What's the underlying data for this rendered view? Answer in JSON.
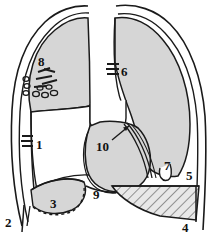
{
  "figure": {
    "name": "chest-radiograph-line-diagram",
    "colors": {
      "ink": "#1a1a1a",
      "lung_fill": "#d6d6d6",
      "effusion_fill": "#e3e3e3",
      "background": "#ffffff"
    }
  },
  "labels": [
    {
      "id": "label-1",
      "text": "1",
      "x": 36,
      "y": 144,
      "tick_marks": 3,
      "tick_side": "left"
    },
    {
      "id": "label-2",
      "text": "2",
      "x": 9,
      "y": 222,
      "tick_marks": 0,
      "tick_side": "none"
    },
    {
      "id": "label-3",
      "text": "3",
      "x": 54,
      "y": 203,
      "tick_marks": 0,
      "tick_side": "none"
    },
    {
      "id": "label-4",
      "text": "4",
      "x": 186,
      "y": 227,
      "tick_marks": 0,
      "tick_side": "none"
    },
    {
      "id": "label-5",
      "text": "5",
      "x": 190,
      "y": 175,
      "tick_marks": 0,
      "tick_side": "none"
    },
    {
      "id": "label-6",
      "text": "6",
      "x": 120,
      "y": 76,
      "tick_marks": 3,
      "tick_side": "left"
    },
    {
      "id": "label-7",
      "text": "7",
      "x": 168,
      "y": 166,
      "tick_marks": 0,
      "tick_side": "none"
    },
    {
      "id": "label-8",
      "text": "8",
      "x": 41,
      "y": 63,
      "tick_marks": 0,
      "tick_side": "none"
    },
    {
      "id": "label-9",
      "text": "9",
      "x": 97,
      "y": 194,
      "tick_marks": 0,
      "tick_side": "none"
    },
    {
      "id": "label-10",
      "text": "10",
      "x": 104,
      "y": 147,
      "tick_marks": 0,
      "tick_side": "none",
      "leader_line": true
    }
  ]
}
